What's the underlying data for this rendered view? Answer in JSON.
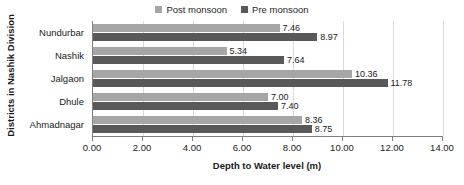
{
  "chart_data": {
    "type": "bar",
    "orientation": "horizontal",
    "title": "",
    "xlabel": "Depth to Water level (m)",
    "ylabel": "Districts in Nashik Division",
    "categories": [
      "Ahmadnagar",
      "Dhule",
      "Jalgaon",
      "Nashik",
      "Nundurbar"
    ],
    "categories_top_to_bottom": [
      "Nundurbar",
      "Nashik",
      "Jalgaon",
      "Dhule",
      "Ahmadnagar"
    ],
    "series": [
      {
        "name": "Post monsoon",
        "color": "#a6a6a6",
        "values": [
          8.36,
          7.0,
          10.36,
          5.34,
          7.46
        ],
        "labels": [
          "8.36",
          "7.00",
          "10.36",
          "5.34",
          "7.46"
        ]
      },
      {
        "name": "Pre monsoon",
        "color": "#595959",
        "values": [
          8.75,
          7.4,
          11.78,
          7.64,
          8.97
        ],
        "labels": [
          "8.75",
          "7.40",
          "11.78",
          "7.64",
          "8.97"
        ]
      }
    ],
    "xlim": [
      0,
      14
    ],
    "xticks": [
      0,
      2,
      4,
      6,
      8,
      10,
      12,
      14
    ],
    "xtick_labels": [
      "0.00",
      "2.00",
      "4.00",
      "6.00",
      "8.00",
      "10.00",
      "12.00",
      "14.00"
    ],
    "grid": "vertical",
    "legend_position": "top-center",
    "gridline_color": "#d9d9d9",
    "axis_color": "#808080"
  },
  "legend": {
    "entries": [
      {
        "label": "Post monsoon"
      },
      {
        "label": "Pre monsoon"
      }
    ]
  },
  "rows": [
    {
      "category": "Nundurbar",
      "post": {
        "value": 7.46,
        "label": "7.46"
      },
      "pre": {
        "value": 8.97,
        "label": "8.97"
      }
    },
    {
      "category": "Nashik",
      "post": {
        "value": 5.34,
        "label": "5.34"
      },
      "pre": {
        "value": 7.64,
        "label": "7.64"
      }
    },
    {
      "category": "Jalgaon",
      "post": {
        "value": 10.36,
        "label": "10.36"
      },
      "pre": {
        "value": 11.78,
        "label": "11.78"
      }
    },
    {
      "category": "Dhule",
      "post": {
        "value": 7.0,
        "label": "7.00"
      },
      "pre": {
        "value": 7.4,
        "label": "7.40"
      }
    },
    {
      "category": "Ahmadnagar",
      "post": {
        "value": 8.36,
        "label": "8.36"
      },
      "pre": {
        "value": 8.75,
        "label": "8.75"
      }
    }
  ],
  "axes": {
    "y_title": "Districts in Nashik Division",
    "x_title": "Depth to Water level (m)"
  }
}
